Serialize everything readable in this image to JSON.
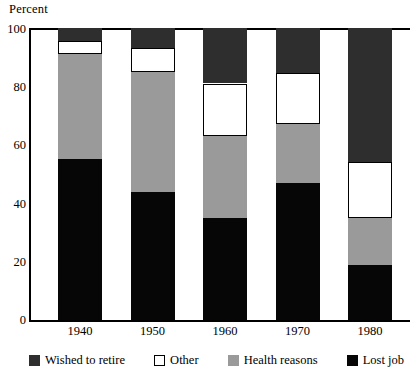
{
  "chart_data": {
    "type": "bar",
    "subtype": "stacked-bar-100-percent",
    "title": "",
    "xlabel": "",
    "ylabel": "Percent",
    "ylim": [
      0,
      100
    ],
    "yticks": [
      0,
      20,
      40,
      60,
      80,
      100
    ],
    "ytick_labels": [
      "0",
      "20",
      "40",
      "60",
      "80",
      "100"
    ],
    "grid": false,
    "legend_position": "bottom",
    "categories": [
      "1940",
      "1950",
      "1960",
      "1970",
      "1980"
    ],
    "series": [
      {
        "name": "Lost job",
        "color": "#060606",
        "values": [
          55,
          44,
          35,
          47,
          19
        ]
      },
      {
        "name": "Health reasons",
        "color": "#9a9a9a",
        "values": [
          36,
          41,
          28,
          20,
          16
        ]
      },
      {
        "name": "Other",
        "color": "#ffffff",
        "values": [
          4.5,
          8,
          18,
          17.5,
          19
        ]
      },
      {
        "name": "Wished to retire",
        "color": "#2e2e2e",
        "values": [
          4.5,
          7,
          19,
          15.5,
          46
        ]
      }
    ],
    "stack_order_bottom_to_top": [
      "Lost job",
      "Health reasons",
      "Other",
      "Wished to retire"
    ],
    "cumulative_tops": {
      "1940": {
        "Lost job": 55,
        "Health reasons": 91,
        "Other": 95.5,
        "Wished to retire": 100
      },
      "1950": {
        "Lost job": 44,
        "Health reasons": 85,
        "Other": 93,
        "Wished to retire": 100
      },
      "1960": {
        "Lost job": 35,
        "Health reasons": 63,
        "Other": 81,
        "Wished to retire": 100
      },
      "1970": {
        "Lost job": 47,
        "Health reasons": 67,
        "Other": 84.5,
        "Wished to retire": 100
      },
      "1980": {
        "Lost job": 19,
        "Health reasons": 35,
        "Other": 54,
        "Wished to retire": 100
      }
    }
  },
  "axis": {
    "y_title": "Percent",
    "y_tick_0": "0",
    "y_tick_20": "20",
    "y_tick_40": "40",
    "y_tick_60": "60",
    "y_tick_80": "80",
    "y_tick_100": "100"
  },
  "xaxis": {
    "labels": [
      {
        "text": "1940"
      },
      {
        "text": "1950"
      },
      {
        "text": "1960"
      },
      {
        "text": "1970"
      },
      {
        "text": "1980"
      }
    ]
  },
  "legend": {
    "items": [
      {
        "label": "Wished to retire",
        "swatch": "dark",
        "color": "#2e2e2e"
      },
      {
        "label": "Other",
        "swatch": "white",
        "color": "#ffffff"
      },
      {
        "label": "Health reasons",
        "swatch": "gray",
        "color": "#9a9a9a"
      },
      {
        "label": "Lost job",
        "swatch": "black",
        "color": "#060606"
      }
    ]
  }
}
